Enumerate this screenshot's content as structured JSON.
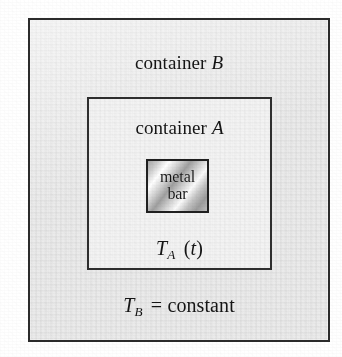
{
  "figure": {
    "name": "nested-containers-thermal-diagram",
    "background_color": "#ffffff"
  },
  "container_b": {
    "label_prefix": "container",
    "label_symbol": "B",
    "fill_color": "#eaeaea",
    "border_color": "#2b2b2b",
    "temperature": {
      "symbol": "T",
      "subscript": "B",
      "relation": "=",
      "value": "constant"
    }
  },
  "container_a": {
    "label_prefix": "container",
    "label_symbol": "A",
    "fill_color": "#f3f3f3",
    "border_color": "#2e2e2e",
    "temperature": {
      "symbol": "T",
      "subscript": "A",
      "argument_open": "(",
      "argument": "t",
      "argument_close": ")"
    }
  },
  "metal_bar": {
    "line1": "metal",
    "line2": "bar",
    "border_color": "#1f1f1f",
    "fill_style": "metallic-diagonal-gradient"
  }
}
